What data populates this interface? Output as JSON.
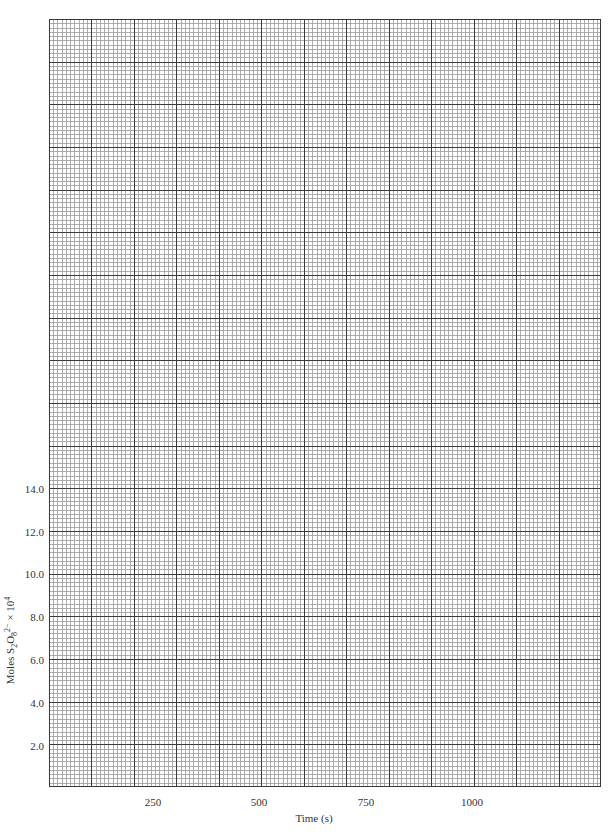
{
  "chart_data": {
    "type": "scatter",
    "title": "",
    "xlabel": "Time (s)",
    "ylabel": "Moles S2O8 2- x 10^4",
    "ylabel_parts": {
      "prefix": "Moles S",
      "sub1": "2",
      "mid": "O",
      "sub2": "8",
      "sup": "2−",
      "suffix": " × 10",
      "exp": "4"
    },
    "xlim": [
      0,
      1300
    ],
    "ylim": [
      0,
      36
    ],
    "x_ticks": [
      250,
      500,
      750,
      1000
    ],
    "x_tick_labels": [
      "250",
      "500",
      "750",
      "1000"
    ],
    "y_ticks": [
      2,
      4,
      6,
      8,
      10,
      12,
      14
    ],
    "y_tick_labels": [
      "2.0",
      "4.0",
      "6.0",
      "8.0",
      "10.0",
      "12.0",
      "14.0"
    ],
    "grid": true,
    "grid_style": "graph paper: major lines every 100 s and 2.0 units, 10 minor divisions each",
    "series": [],
    "legend": null
  },
  "colors": {
    "major_line": "#3a3a3a",
    "minor_line": "#9a9a9a",
    "text": "#333333"
  }
}
